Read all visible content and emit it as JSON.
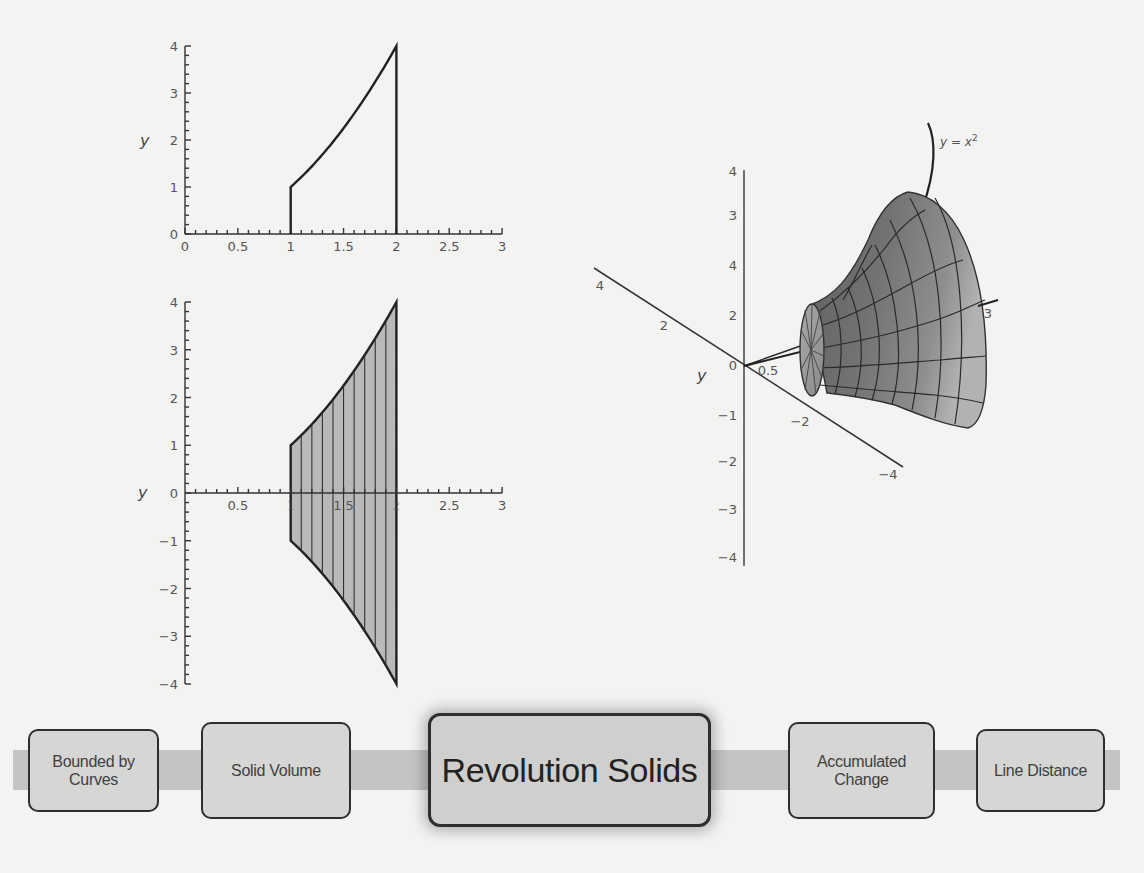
{
  "chart_data": [
    {
      "type": "area",
      "title": "",
      "description": "Region under y = x^2 between x = 1 and x = 2",
      "xlabel": "",
      "ylabel": "y",
      "xlim": [
        0,
        3
      ],
      "ylim": [
        0,
        4
      ],
      "x_ticks": [
        "0",
        "0.5",
        "1",
        "1.5",
        "2",
        "2.5",
        "3"
      ],
      "y_ticks": [
        "0",
        "1",
        "2",
        "3",
        "4"
      ],
      "function": "y = x^2",
      "x_range": [
        1,
        2
      ],
      "x": [
        1.0,
        1.1,
        1.2,
        1.3,
        1.4,
        1.5,
        1.6,
        1.7,
        1.8,
        1.9,
        2.0
      ],
      "y": [
        1.0,
        1.21,
        1.44,
        1.69,
        1.96,
        2.25,
        2.56,
        2.89,
        3.24,
        3.61,
        4.0
      ],
      "grid": false
    },
    {
      "type": "area",
      "title": "",
      "description": "Cross-section of solid of revolution: region between y = x^2 and y = -x^2 for 1 <= x <= 2, with vertical slices",
      "xlabel": "",
      "ylabel": "y",
      "xlim": [
        0,
        3
      ],
      "ylim": [
        -4,
        4
      ],
      "x_ticks": [
        "0.5",
        "1",
        "1.5",
        "2",
        "2.5",
        "3"
      ],
      "y_ticks": [
        "-4",
        "-3",
        "-2",
        "-1",
        "0",
        "1",
        "2",
        "3",
        "4"
      ],
      "series": [
        {
          "name": "upper",
          "x": [
            1.0,
            1.1,
            1.2,
            1.3,
            1.4,
            1.5,
            1.6,
            1.7,
            1.8,
            1.9,
            2.0
          ],
          "y": [
            1.0,
            1.21,
            1.44,
            1.69,
            1.96,
            2.25,
            2.56,
            2.89,
            3.24,
            3.61,
            4.0
          ]
        },
        {
          "name": "lower",
          "x": [
            1.0,
            1.1,
            1.2,
            1.3,
            1.4,
            1.5,
            1.6,
            1.7,
            1.8,
            1.9,
            2.0
          ],
          "y": [
            -1.0,
            -1.21,
            -1.44,
            -1.69,
            -1.96,
            -2.25,
            -2.56,
            -2.89,
            -3.24,
            -3.61,
            -4.0
          ]
        }
      ],
      "slice_lines_at_x": [
        1.1,
        1.2,
        1.3,
        1.4,
        1.5,
        1.6,
        1.7,
        1.8,
        1.9
      ],
      "grid": false
    },
    {
      "type": "surface",
      "title": "",
      "description": "3D solid of revolution obtained by rotating y = x^2 (1 <= x <= 2) about the x-axis",
      "curve_label": "y = x²",
      "axes": {
        "vertical_ticks": [
          "-4",
          "-3",
          "-2",
          "-1",
          "0",
          "2",
          "4",
          "3",
          "4"
        ],
        "depth_ticks": [
          "4",
          "2",
          "-2",
          "-4"
        ],
        "x_ticks": [
          "0.5",
          "3"
        ],
        "y_label": "y"
      }
    }
  ],
  "plots": {
    "top": {
      "y_label": "y",
      "x_ticks": [
        {
          "v": 0,
          "label": "0"
        },
        {
          "v": 0.5,
          "label": "0.5"
        },
        {
          "v": 1,
          "label": "1"
        },
        {
          "v": 1.5,
          "label": "1.5"
        },
        {
          "v": 2,
          "label": "2"
        },
        {
          "v": 2.5,
          "label": "2.5"
        },
        {
          "v": 3,
          "label": "3"
        }
      ],
      "y_ticks": [
        {
          "v": 0,
          "label": "0"
        },
        {
          "v": 1,
          "label": "1"
        },
        {
          "v": 2,
          "label": "2"
        },
        {
          "v": 3,
          "label": "3"
        },
        {
          "v": 4,
          "label": "4"
        }
      ]
    },
    "bottom": {
      "y_label": "y",
      "x_ticks": [
        {
          "v": 0.5,
          "label": "0.5"
        },
        {
          "v": 1,
          "label": "1"
        },
        {
          "v": 1.5,
          "label": "1.5"
        },
        {
          "v": 2,
          "label": "2"
        },
        {
          "v": 2.5,
          "label": "2.5"
        },
        {
          "v": 3,
          "label": "3"
        }
      ],
      "y_ticks": [
        {
          "v": 4,
          "label": "4"
        },
        {
          "v": 3,
          "label": "3"
        },
        {
          "v": 2,
          "label": "2"
        },
        {
          "v": 1,
          "label": "1"
        },
        {
          "v": 0,
          "label": "0"
        },
        {
          "v": -1,
          "label": "−1"
        },
        {
          "v": -2,
          "label": "−2"
        },
        {
          "v": -3,
          "label": "−3"
        },
        {
          "v": -4,
          "label": "−4"
        }
      ]
    },
    "solid3d": {
      "curve_label_y": "y",
      "curve_label_eq": " = ",
      "curve_label_x": "x",
      "curve_label_exp": "2",
      "y_axis_label": "y",
      "vertical_ticks": [
        {
          "label": "4",
          "y": 176
        },
        {
          "label": "3",
          "y": 220
        },
        {
          "label": "4",
          "y": 270
        },
        {
          "label": "2",
          "y": 320
        },
        {
          "label": "0",
          "y": 370
        },
        {
          "label": "−1",
          "y": 420
        },
        {
          "label": "−2",
          "y": 466
        },
        {
          "label": "−3",
          "y": 514
        },
        {
          "label": "−4",
          "y": 562
        }
      ],
      "depth_ticks": [
        {
          "label": "4",
          "x": 600,
          "y": 290
        },
        {
          "label": "2",
          "x": 664,
          "y": 330
        },
        {
          "label": "−2",
          "x": 800,
          "y": 426
        },
        {
          "label": "−4",
          "x": 888,
          "y": 479
        }
      ],
      "x_ticks": [
        {
          "label": "0.5",
          "x": 768,
          "y": 375
        },
        {
          "label": "3",
          "x": 988,
          "y": 318
        }
      ]
    }
  },
  "navigation": {
    "items": [
      {
        "lines": [
          "Bounded by",
          "Curves"
        ],
        "active": false
      },
      {
        "lines": [
          "Solid Volume"
        ],
        "active": false
      },
      {
        "lines": [
          "Revolution Solids"
        ],
        "active": true
      },
      {
        "lines": [
          "Accumulated",
          "Change"
        ],
        "active": false
      },
      {
        "lines": [
          "Line Distance"
        ],
        "active": false
      }
    ]
  },
  "colors": {
    "background": "#f3f3f1",
    "band": "#c4c4c2",
    "box_fill": "#d6d6d4",
    "box_border": "#2e2e2e",
    "region_fill": "#b8b8b8",
    "surface_dark": "#6e6e6e",
    "surface_light": "#b4b4b4",
    "ink": "#2b2b2b"
  }
}
